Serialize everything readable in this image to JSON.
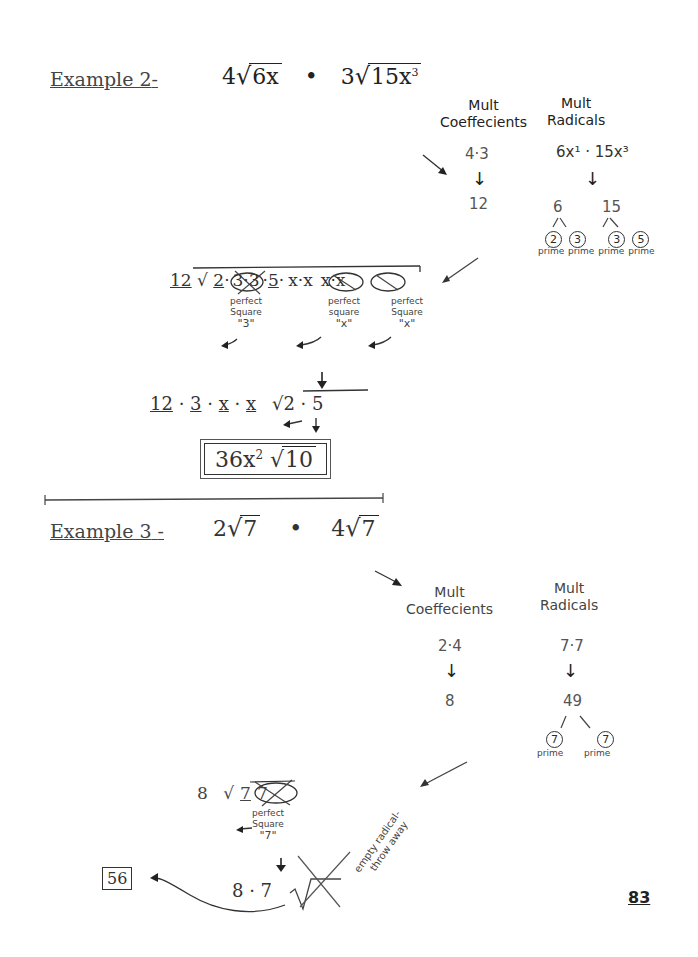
{
  "page_number": "83",
  "example2": {
    "label": "Example 2",
    "label_dash": "-",
    "problem": {
      "coef1": "4",
      "radicand1": "6x",
      "dot": "•",
      "coef2": "3",
      "radicand2": "15x",
      "radicand2_exp": "3"
    },
    "mult_coefficients": {
      "heading_line1": "Mult",
      "heading_line2": "Coeffecients",
      "expr": "4·3",
      "result": "12"
    },
    "mult_radicals": {
      "heading_line1": "Mult",
      "heading_line2": "Radicals",
      "expr": "6x¹ · 15x³"
    },
    "factor_trees": [
      {
        "value": "6",
        "factors": [
          "2",
          "3"
        ],
        "labels": [
          "prime",
          "prime"
        ]
      },
      {
        "value": "15",
        "factors": [
          "3",
          "5"
        ],
        "labels": [
          "prime",
          "prime"
        ]
      }
    ],
    "expanded": {
      "coef": "12",
      "radicand_terms": [
        "2",
        "3·3",
        "5",
        "x·x",
        "x·x"
      ],
      "annotations": [
        {
          "line1": "perfect",
          "line2": "Square",
          "pulled": "\"3\""
        },
        {
          "line1": "perfect",
          "line2": "square",
          "pulled": "\"x\""
        },
        {
          "line1": "perfect",
          "line2": "Square",
          "pulled": "\"x\""
        }
      ]
    },
    "simplified_step": {
      "outside": [
        "12",
        "3",
        "x",
        "x"
      ],
      "inside": "2 · 5"
    },
    "answer": {
      "coef": "36x",
      "exp": "2",
      "radicand": "10"
    }
  },
  "example3": {
    "label": "Example 3",
    "label_dash": "-",
    "problem": {
      "coef1": "2",
      "radicand1": "7",
      "dot": "•",
      "coef2": "4",
      "radicand2": "7"
    },
    "mult_coefficients": {
      "heading_line1": "Mult",
      "heading_line2": "Coeffecients",
      "expr": "2·4",
      "result": "8"
    },
    "mult_radicals": {
      "heading_line1": "Mult",
      "heading_line2": "Radicals",
      "expr": "7·7",
      "result": "49"
    },
    "factor_tree": {
      "value": "49",
      "factors": [
        "7",
        "7"
      ],
      "labels": [
        "prime",
        "prime"
      ]
    },
    "expanded": {
      "coef": "8",
      "radicand_terms": [
        "7",
        "7"
      ],
      "annotation": {
        "line1": "perfect",
        "line2": "Square",
        "pulled": "\"7\""
      }
    },
    "simplified_step": {
      "expr": "8 · 7"
    },
    "note": {
      "line1": "empty radical-",
      "line2": "throw away"
    },
    "answer": "56"
  },
  "symbols": {
    "sqrt": "√",
    "arrow_down": "↓",
    "arrow_left": "←"
  }
}
